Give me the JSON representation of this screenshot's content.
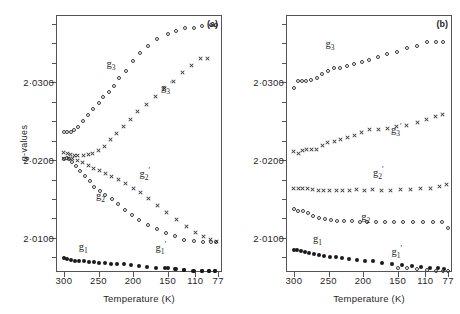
{
  "figure": {
    "yaxis_title": "g-values",
    "xaxis_title": "Temperature (K)",
    "y_ticklabels": [
      "2·0300",
      "2·0200",
      "2·0100"
    ],
    "x_ticklabels": [
      "300",
      "250",
      "200",
      "150",
      "110",
      "77"
    ]
  },
  "panels": [
    {
      "tag": "(a)",
      "xaxis_title": "Temperature (K)",
      "yaxis_title": "g-values",
      "annotations": [
        {
          "label": "g₃",
          "text_main": "g",
          "sub": "3",
          "sup": ""
        },
        {
          "label": "g₃'",
          "text_main": "g",
          "sub": "3",
          "sup": "+"
        },
        {
          "label": "g₂",
          "text_main": "g",
          "sub": "2",
          "sup": ""
        },
        {
          "label": "g₂'",
          "text_main": "g",
          "sub": "2",
          "sup": "+"
        },
        {
          "label": "g₁",
          "text_main": "g",
          "sub": "1",
          "sup": ""
        },
        {
          "label": "g₁'",
          "text_main": "g",
          "sub": "1",
          "sup": "+"
        }
      ]
    },
    {
      "tag": "(b)",
      "xaxis_title": "Temperature (K)",
      "annotations": [
        {
          "label": "g₃",
          "text_main": "g",
          "sub": "3",
          "sup": ""
        },
        {
          "label": "g₃'",
          "text_main": "g",
          "sub": "3",
          "sup": "+"
        },
        {
          "label": "g₂'",
          "text_main": "g",
          "sub": "2",
          "sup": "+"
        },
        {
          "label": "g₂",
          "text_main": "g",
          "sub": "2",
          "sup": ""
        },
        {
          "label": "g₁",
          "text_main": "g",
          "sub": "1",
          "sup": ""
        },
        {
          "label": "g₁'",
          "text_main": "g",
          "sub": "1",
          "sup": "+"
        }
      ]
    }
  ],
  "chart_data": [
    {
      "type": "scatter",
      "panel": "(a)",
      "title": "",
      "xlabel": "Temperature (K)",
      "ylabel": "g-values",
      "xlim": [
        310,
        70
      ],
      "ylim": [
        2.0055,
        2.0385
      ],
      "x_ticks": [
        300,
        250,
        200,
        150,
        110,
        77
      ],
      "y_ticks": [
        2.03,
        2.02,
        2.01
      ],
      "y_minor_ticks": [
        2.035,
        2.025,
        2.015,
        2.01,
        2.0075
      ],
      "grid": false,
      "legend": "inline-annotations",
      "series": [
        {
          "name": "g3",
          "marker": "open-circle",
          "annotation": "g₃",
          "annotation_at": {
            "x": 232,
            "y": 2.0322
          },
          "x": [
            300,
            295,
            290,
            285,
            280,
            272,
            265,
            258,
            250,
            243,
            235,
            228,
            220,
            210,
            200,
            190,
            178,
            165,
            150,
            138,
            125,
            112,
            100,
            88,
            80
          ],
          "y": [
            2.0236,
            2.0236,
            2.0236,
            2.0239,
            2.0243,
            2.025,
            2.0258,
            2.0265,
            2.0273,
            2.0281,
            2.0288,
            2.0295,
            2.0305,
            2.0315,
            2.0327,
            2.0337,
            2.0346,
            2.0355,
            2.0362,
            2.0366,
            2.0369,
            2.037,
            2.0372,
            2.0374,
            2.0374
          ]
        },
        {
          "name": "g3prime",
          "marker": "cross",
          "annotation": "g₃⁺",
          "annotation_at": {
            "x": 152,
            "y": 2.0293
          },
          "x": [
            300,
            295,
            290,
            285,
            280,
            272,
            265,
            258,
            250,
            242,
            233,
            224,
            214,
            204,
            193,
            181,
            168,
            155,
            142,
            128,
            115,
            102,
            92
          ],
          "y": [
            2.021,
            2.0208,
            2.0207,
            2.0206,
            2.0206,
            2.0206,
            2.0207,
            2.0209,
            2.0212,
            2.0218,
            2.0226,
            2.0234,
            2.0243,
            2.0252,
            2.0262,
            2.0272,
            2.0282,
            2.0292,
            2.0301,
            2.0312,
            2.0322,
            2.033,
            2.033
          ]
        },
        {
          "name": "g2",
          "marker": "open-circle",
          "annotation": "g₂",
          "annotation_at": {
            "x": 247,
            "y": 2.0152
          },
          "x": [
            300,
            296,
            292,
            288,
            283,
            277,
            270,
            263,
            256,
            248,
            240,
            231,
            222,
            212,
            202,
            191,
            179,
            166,
            153,
            140,
            126,
            112,
            99,
            88,
            80
          ],
          "y": [
            2.0202,
            2.0203,
            2.0201,
            2.0197,
            2.0192,
            2.0186,
            2.018,
            2.0173,
            2.0166,
            2.016,
            2.0155,
            2.015,
            2.0143,
            2.0136,
            2.0129,
            2.0123,
            2.0117,
            2.0111,
            2.0106,
            2.0102,
            2.0098,
            2.0096,
            2.0095,
            2.0095,
            2.0095
          ]
        },
        {
          "name": "g2prime",
          "marker": "cross",
          "annotation": "g₂⁺",
          "annotation_at": {
            "x": 183,
            "y": 2.0182
          },
          "x": [
            300,
            294,
            288,
            281,
            273,
            265,
            257,
            249,
            240,
            231,
            221,
            211,
            200,
            189,
            177,
            164,
            151,
            137,
            123,
            110,
            98,
            88,
            80
          ],
          "y": [
            2.0202,
            2.0202,
            2.0202,
            2.02,
            2.0197,
            2.0193,
            2.0189,
            2.0186,
            2.0183,
            2.0179,
            2.0175,
            2.017,
            2.0164,
            2.0158,
            2.0151,
            2.0142,
            2.0133,
            2.0124,
            2.0115,
            2.0107,
            2.0102,
            2.0098,
            2.0096
          ]
        },
        {
          "name": "g1",
          "marker": "filled-circle",
          "annotation": "g₁",
          "annotation_at": {
            "x": 272,
            "y": 2.0087
          },
          "x": [
            300,
            295,
            290,
            284,
            278,
            271,
            264,
            257,
            249,
            241,
            232,
            223,
            213,
            203,
            192,
            180,
            167,
            154,
            140,
            126,
            112,
            100,
            90,
            82
          ],
          "y": [
            2.0074,
            2.0073,
            2.0072,
            2.0071,
            2.007,
            2.007,
            2.0069,
            2.0069,
            2.0068,
            2.0068,
            2.0067,
            2.0066,
            2.0066,
            2.0065,
            2.0064,
            2.0063,
            2.0062,
            2.0061,
            2.006,
            2.0059,
            2.0058,
            2.0058,
            2.0057,
            2.0057
          ]
        },
        {
          "name": "g1prime",
          "marker": "filled-circle",
          "annotation": "g₁⁺",
          "annotation_at": {
            "x": 160,
            "y": 2.0087
          },
          "x": [
            150,
            138,
            126,
            113,
            100,
            90,
            82
          ],
          "y": [
            2.0061,
            2.006,
            2.0059,
            2.0058,
            2.0058,
            2.0057,
            2.0057
          ]
        }
      ]
    },
    {
      "type": "scatter",
      "panel": "(b)",
      "title": "",
      "xlabel": "Temperature (K)",
      "ylabel": "g-values",
      "xlim": [
        310,
        70
      ],
      "ylim": [
        2.0055,
        2.0385
      ],
      "x_ticks": [
        300,
        250,
        200,
        150,
        110,
        77
      ],
      "y_ticks": [
        2.03,
        2.02,
        2.01
      ],
      "grid": false,
      "legend": "inline-annotations",
      "series": [
        {
          "name": "g3",
          "marker": "open-circle",
          "annotation": "g₃",
          "annotation_at": {
            "x": 248,
            "y": 2.0348
          },
          "x": [
            300,
            294,
            288,
            282,
            275,
            267,
            259,
            251,
            242,
            233,
            223,
            213,
            202,
            191,
            178,
            165,
            151,
            137,
            122,
            108,
            95,
            84
          ],
          "y": [
            2.0292,
            2.0301,
            2.0302,
            2.0302,
            2.0303,
            2.0306,
            2.031,
            2.0315,
            2.0318,
            2.0318,
            2.0321,
            2.0324,
            2.0326,
            2.0329,
            2.0332,
            2.0336,
            2.0339,
            2.0344,
            2.0347,
            2.0352,
            2.0352,
            2.0352
          ]
        },
        {
          "name": "g3prime",
          "marker": "cross",
          "annotation": "g₃⁺",
          "annotation_at": {
            "x": 152,
            "y": 2.0238
          },
          "x": [
            300,
            294,
            288,
            282,
            275,
            267,
            259,
            251,
            242,
            233,
            223,
            213,
            202,
            191,
            178,
            165,
            151,
            137,
            122,
            108,
            95,
            85
          ],
          "y": [
            2.0211,
            2.0209,
            2.0212,
            2.0213,
            2.0213,
            2.0213,
            2.0219,
            2.0222,
            2.0224,
            2.0226,
            2.0229,
            2.0231,
            2.0236,
            2.0239,
            2.0239,
            2.0241,
            2.0243,
            2.0244,
            2.0248,
            2.0252,
            2.0256,
            2.0258
          ]
        },
        {
          "name": "g2prime",
          "marker": "cross",
          "annotation": "g₂⁺",
          "annotation_at": {
            "x": 178,
            "y": 2.0184
          },
          "x": [
            300,
            294,
            288,
            281,
            273,
            265,
            257,
            248,
            239,
            230,
            220,
            209,
            198,
            186,
            173,
            160,
            146,
            132,
            117,
            103,
            90,
            80
          ],
          "y": [
            2.0163,
            2.0164,
            2.0163,
            2.0164,
            2.0162,
            2.0161,
            2.0161,
            2.0161,
            2.0161,
            2.0161,
            2.0161,
            2.0162,
            2.0161,
            2.0162,
            2.0161,
            2.0161,
            2.0162,
            2.0162,
            2.0163,
            2.0164,
            2.0166,
            2.0169
          ]
        },
        {
          "name": "g2",
          "marker": "open-circle",
          "annotation": "g₂",
          "annotation_at": {
            "x": 196,
            "y": 2.0126
          },
          "x": [
            300,
            294,
            287,
            280,
            272,
            264,
            255,
            246,
            237,
            227,
            216,
            205,
            194,
            182,
            169,
            156,
            142,
            128,
            113,
            99,
            86,
            77
          ],
          "y": [
            2.0137,
            2.0134,
            2.0134,
            2.0132,
            2.0128,
            2.0126,
            2.0124,
            2.0123,
            2.0122,
            2.0122,
            2.0122,
            2.0121,
            2.0121,
            2.0121,
            2.0121,
            2.012,
            2.012,
            2.012,
            2.012,
            2.012,
            2.012,
            2.0113
          ]
        },
        {
          "name": "g1",
          "marker": "filled-circle",
          "annotation": "g₁",
          "annotation_at": {
            "x": 266,
            "y": 2.0098
          },
          "x": [
            300,
            295,
            290,
            284,
            278,
            271,
            264,
            256,
            248,
            239,
            230,
            220,
            209,
            197,
            185,
            172,
            158,
            144,
            130,
            116,
            103,
            92,
            83
          ],
          "y": [
            2.0085,
            2.0084,
            2.0083,
            2.0082,
            2.0081,
            2.008,
            2.0078,
            2.0077,
            2.0076,
            2.0075,
            2.0074,
            2.0073,
            2.0072,
            2.0071,
            2.007,
            2.0068,
            2.0067,
            2.0065,
            2.0064,
            2.0063,
            2.0062,
            2.0061,
            2.006
          ]
        },
        {
          "name": "g1prime",
          "marker": "open-circle",
          "annotation": "g₁⁺",
          "annotation_at": {
            "x": 151,
            "y": 2.0082
          },
          "x": [
            150,
            136,
            122,
            108,
            95,
            84,
            77
          ],
          "y": [
            2.0062,
            2.0061,
            2.006,
            2.0059,
            2.0058,
            2.0058,
            2.0057
          ]
        }
      ]
    }
  ]
}
